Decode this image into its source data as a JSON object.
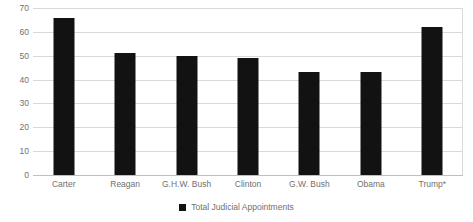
{
  "chart_data": {
    "type": "bar",
    "title": "",
    "subtitle": "",
    "xlabel": "",
    "ylabel": "",
    "categories": [
      "Carter",
      "Reagan",
      "G.H.W. Bush",
      "Clinton",
      "G.W. Bush",
      "Obama",
      "Trump*"
    ],
    "series": [
      {
        "name": "Total Judicial Appointments",
        "color": "#121212",
        "values": [
          66,
          51,
          50,
          49,
          43,
          43,
          62
        ]
      }
    ],
    "values": [
      66,
      51,
      50,
      49,
      43,
      43,
      62
    ],
    "ylim": [
      0,
      70
    ],
    "ytick_values": [
      0,
      10,
      20,
      30,
      40,
      50,
      60,
      70
    ],
    "ytick_labels": [
      "0",
      "10",
      "20",
      "30",
      "40",
      "50",
      "60",
      "70"
    ],
    "grid": true,
    "grid_axis": "y",
    "grid_color": "#d9d9d9",
    "legend": {
      "position": "bottom",
      "entries": [
        {
          "label": "Total Judicial Appointments",
          "marker": "square-marker",
          "color": "#121212"
        }
      ]
    },
    "annotations": [],
    "axis_label_color": "#707070",
    "background_color": "#ffffff"
  }
}
